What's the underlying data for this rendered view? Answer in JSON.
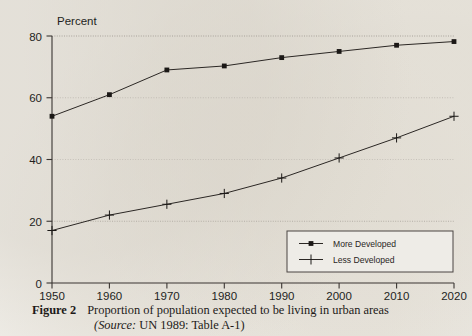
{
  "figure": {
    "label": "Figure 2",
    "caption_line1": "Proportion of population expected to be living in urban areas",
    "source_prefix": "(Source:",
    "source_rest": " UN 1989: Table A-1)"
  },
  "chart_data": {
    "type": "line",
    "title": "",
    "ylabel": "Percent",
    "xlabel": "",
    "categories": [
      1950,
      1960,
      1970,
      1980,
      1990,
      2000,
      2010,
      2020
    ],
    "x": [
      1950,
      1960,
      1970,
      1980,
      1990,
      2000,
      2010,
      2020
    ],
    "xlim": [
      1950,
      2020
    ],
    "ylim": [
      0,
      80
    ],
    "xticks": [
      "1950",
      "1960",
      "1970",
      "1980",
      "1990",
      "2000",
      "2010",
      "2020"
    ],
    "yticks": [
      "0",
      "20",
      "40",
      "60",
      "80"
    ],
    "ytick_values": [
      0,
      20,
      40,
      60,
      80
    ],
    "grid": true,
    "legend_position": "bottom-right",
    "series": [
      {
        "name": "More Developed",
        "marker": "square",
        "values": [
          54,
          61,
          69,
          70.3,
          73,
          75,
          77,
          78.2
        ]
      },
      {
        "name": "Less Developed",
        "marker": "plus",
        "values": [
          17,
          22,
          25.5,
          29,
          34,
          40.5,
          47,
          54
        ]
      }
    ]
  },
  "colors": {
    "page_background": "#f3f1ec",
    "ink": "#231f1d",
    "grid": "#b9b4ab",
    "legend_border": "#4a4542"
  }
}
